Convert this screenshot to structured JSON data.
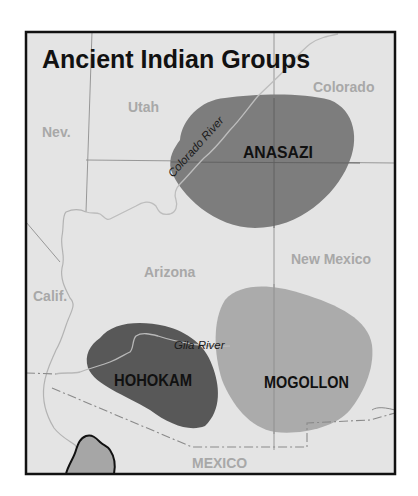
{
  "map": {
    "title": "Ancient Indian Groups",
    "states": [
      {
        "name": "Nev.",
        "x": 37,
        "y": 135
      },
      {
        "name": "Utah",
        "x": 128,
        "y": 112
      },
      {
        "name": "Colorado",
        "x": 313,
        "y": 92
      },
      {
        "name": "Arizona",
        "x": 144,
        "y": 276
      },
      {
        "name": "New Mexico",
        "x": 291,
        "y": 263
      },
      {
        "name": "Calif.",
        "x": 33,
        "y": 302
      },
      {
        "name": "MEXICO",
        "x": 192,
        "y": 468
      }
    ],
    "groups": [
      {
        "name": "ANASAZI",
        "x": 243,
        "y": 158,
        "color": "#7d7d7d"
      },
      {
        "name": "HOHOKAM",
        "x": 114,
        "y": 386,
        "color": "#585858"
      },
      {
        "name": "MOGOLLON",
        "x": 264,
        "y": 388,
        "color": "#ababab"
      }
    ],
    "rivers": [
      {
        "name": "Colorado River",
        "x": 172,
        "y": 176,
        "rotate": -47
      },
      {
        "name": "Gila River",
        "x": 174,
        "y": 349,
        "rotate": 0
      }
    ],
    "colors": {
      "land": "#e4e4e4",
      "frame": "#111111",
      "border": "#9a9a9a",
      "river": "#b5b5b5",
      "gulf": "#a6a6a6"
    }
  }
}
